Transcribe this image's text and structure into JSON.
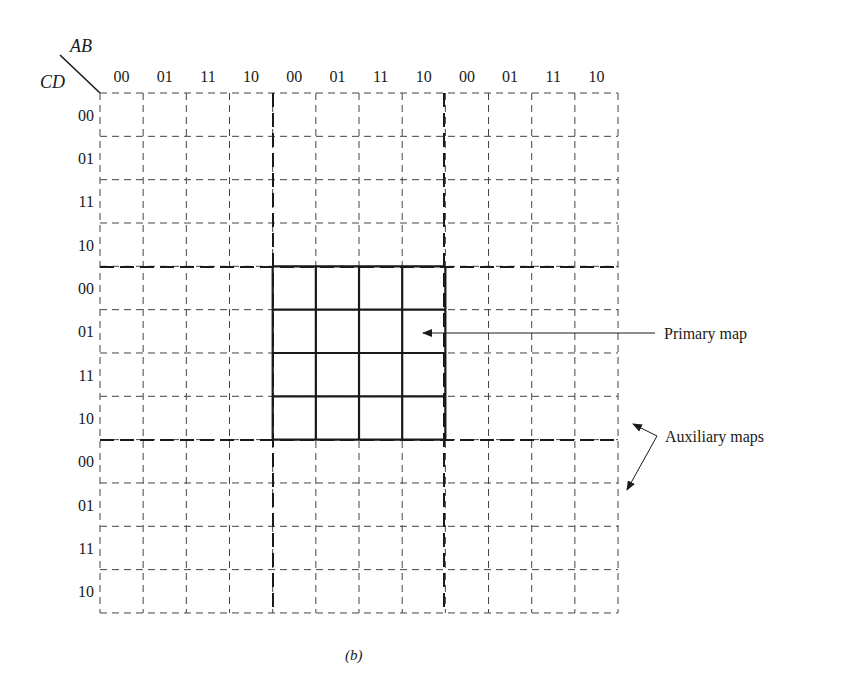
{
  "figure": {
    "caption": "(b)",
    "corner": {
      "column_var": "AB",
      "row_var": "CD"
    },
    "column_labels": [
      "00",
      "01",
      "11",
      "10",
      "00",
      "01",
      "11",
      "10",
      "00",
      "01",
      "11",
      "10"
    ],
    "row_labels": [
      "00",
      "01",
      "11",
      "10",
      "00",
      "01",
      "11",
      "10",
      "00",
      "01",
      "11",
      "10"
    ],
    "annotations": {
      "primary": "Primary map",
      "auxiliary": "Auxiliary maps"
    },
    "colors": {
      "ink": "#1a1a1a",
      "dashed": "#444444",
      "background": "#ffffff"
    }
  }
}
